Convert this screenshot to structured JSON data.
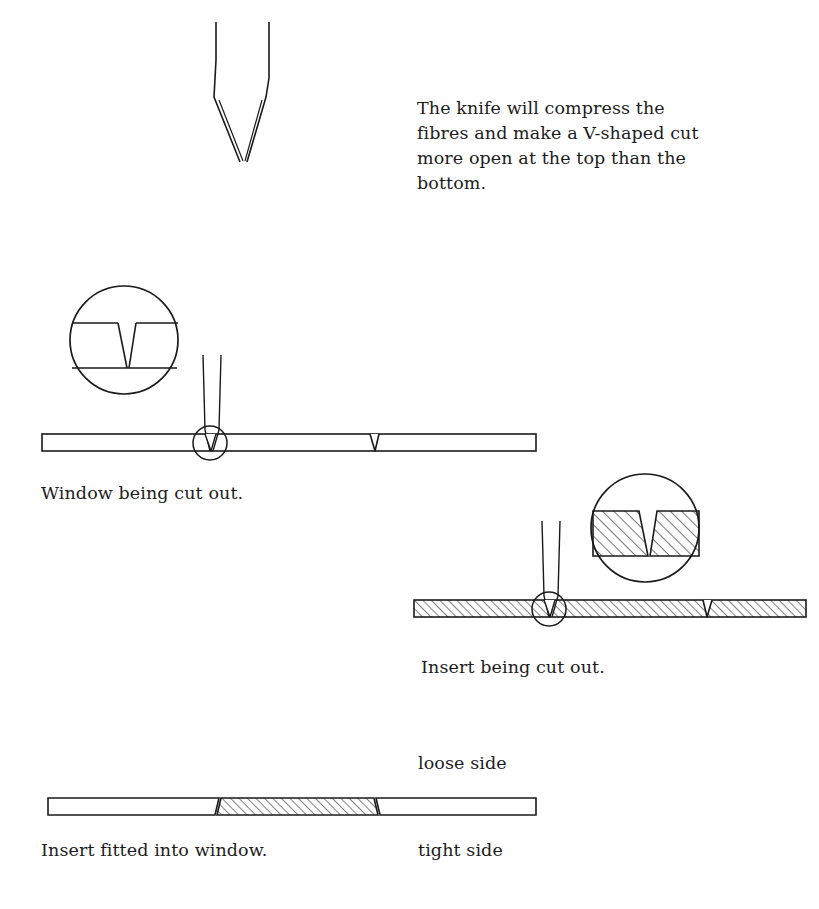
{
  "document": {
    "title": "Knife Cut Diagram — Window and Insert Mount Cutting",
    "background_color": "#ffffff",
    "ink_color": "#1a1a1a"
  },
  "intro": {
    "text": "The knife will compress the fibres and make a V-shaped cut more open at the top than the bottom."
  },
  "captions": {
    "window": "Window being cut out.",
    "insert": "Insert being cut out.",
    "fitted": "Insert fitted into window."
  },
  "labels": {
    "loose_side": "loose side",
    "tight_side": "tight side"
  },
  "figures": [
    {
      "id": "knife-detail",
      "name": "knife-penetrating-board-detail",
      "description": "Enlarged cross-section of a knife blade angled through board; cut is wider at the top surface and narrows to a point at the bottom.",
      "surface_top_y": 97,
      "surface_bottom_y": 163,
      "board_left_x": 42,
      "board_right_x": 366,
      "blade_tip_x": 243,
      "blade_angle_deg": 9
    },
    {
      "id": "window-board",
      "name": "window-board-being-cut",
      "description": "Plain (unhatched) board seen edge-on with a knife entering at a circled detail point and a V-notch further right.",
      "board_left_x": 42,
      "board_right_x": 536,
      "board_top_y": 434,
      "board_bottom_y": 451,
      "knife_x": 210,
      "notch_x": 374,
      "marker_circle": {
        "cx": 210,
        "cy": 443,
        "r": 17
      },
      "inset": {
        "cx": 124,
        "cy": 340,
        "r": 54,
        "hatched": false
      }
    },
    {
      "id": "insert-board",
      "name": "insert-board-being-cut",
      "description": "Hatched board seen edge-on with a knife entering at a circled detail point and a V-notch further right.",
      "board_left_x": 414,
      "board_right_x": 806,
      "board_top_y": 600,
      "board_bottom_y": 617,
      "knife_x": 549,
      "notch_x": 707,
      "marker_circle": {
        "cx": 549,
        "cy": 609,
        "r": 17
      },
      "inset": {
        "cx": 645,
        "cy": 528,
        "r": 54,
        "hatched": true
      }
    },
    {
      "id": "fitted-board",
      "name": "insert-fitted-into-window",
      "description": "Assembled board: plain window stock at left and right with the hatched insert seated between angled V-cut edges.",
      "board_left_x": 48,
      "board_right_x": 536,
      "board_top_y": 798,
      "board_bottom_y": 815,
      "insert_left_x": 215,
      "insert_right_x": 375
    }
  ],
  "hatching": {
    "angle_deg": 45,
    "spacing_px": 6,
    "stroke_color": "#1a1a1a",
    "stroke_width": 1.1
  }
}
